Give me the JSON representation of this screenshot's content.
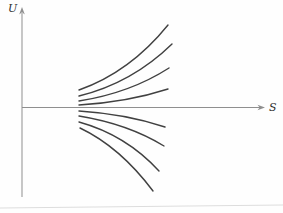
{
  "figure": {
    "width": 283,
    "height": 213,
    "background": "#fefefe",
    "axis": {
      "color": "#8f8f8f",
      "origin": {
        "x": 22,
        "y": 107.5
      },
      "y_axis": {
        "label": "U",
        "top": 13,
        "bottom": 197,
        "arrow_tip": 7
      },
      "x_axis": {
        "label": "S",
        "from": 22,
        "to": 260,
        "arrow_tip": 265
      }
    },
    "curves": {
      "color": "#414141",
      "stroke_width": 1.4,
      "upper": [
        [
          79,
          90,
          130,
          72,
          168,
          25
        ],
        [
          79,
          96,
          132,
          83,
          172,
          44
        ],
        [
          79,
          101,
          130,
          93,
          169,
          68
        ],
        [
          79,
          105,
          128,
          102,
          168,
          89
        ]
      ],
      "lower": [
        [
          79,
          111,
          126,
          114,
          165,
          127
        ],
        [
          79,
          116,
          128,
          124,
          164,
          146
        ],
        [
          79,
          122,
          126,
          135,
          159,
          171
        ],
        [
          80,
          128,
          120,
          147,
          153,
          191
        ]
      ]
    },
    "page_edge": {
      "color": "#dddddd",
      "x1": 0,
      "y1": 208,
      "x2": 283,
      "y2": 205
    }
  }
}
